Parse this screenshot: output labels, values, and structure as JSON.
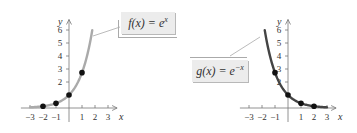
{
  "chart_data": [
    {
      "type": "line",
      "title": "",
      "function_label": "f(x) = e^x",
      "xlabel": "x",
      "ylabel": "y",
      "x_ticks": [
        -3,
        -2,
        -1,
        1,
        2,
        3
      ],
      "y_ticks": [
        2,
        3,
        4,
        5,
        6
      ],
      "xlim": [
        -3.5,
        3.5
      ],
      "ylim": [
        0,
        6.5
      ],
      "grid": false,
      "curve_color": "#aaaaaa",
      "series": [
        {
          "name": "f(x) = e^x",
          "x": [
            -3,
            -2.5,
            -2,
            -1.5,
            -1,
            -0.5,
            0,
            0.5,
            1,
            1.5,
            1.79
          ],
          "values": [
            0.05,
            0.08,
            0.14,
            0.22,
            0.37,
            0.61,
            1,
            1.65,
            2.72,
            4.48,
            6
          ]
        }
      ],
      "points": [
        {
          "x": -2,
          "y": 0.135
        },
        {
          "x": -1,
          "y": 0.368
        },
        {
          "x": 0,
          "y": 1
        },
        {
          "x": 1,
          "y": 2.718
        }
      ]
    },
    {
      "type": "line",
      "title": "",
      "function_label": "g(x) = e^-x",
      "xlabel": "x",
      "ylabel": "y",
      "x_ticks": [
        -3,
        -2,
        -1,
        1,
        2,
        3
      ],
      "y_ticks": [
        2,
        3,
        4,
        5,
        6
      ],
      "xlim": [
        -3.5,
        3.5
      ],
      "ylim": [
        0,
        6.5
      ],
      "grid": false,
      "curve_color": "#444444",
      "series": [
        {
          "name": "g(x) = e^-x",
          "x": [
            -1.79,
            -1.5,
            -1,
            -0.5,
            0,
            0.5,
            1,
            1.5,
            2,
            2.5,
            3
          ],
          "values": [
            6,
            4.48,
            2.72,
            1.65,
            1,
            0.61,
            0.37,
            0.22,
            0.14,
            0.08,
            0.05
          ]
        }
      ],
      "points": [
        {
          "x": -1,
          "y": 2.718
        },
        {
          "x": 0,
          "y": 1
        },
        {
          "x": 1,
          "y": 0.368
        },
        {
          "x": 2,
          "y": 0.135
        }
      ]
    }
  ],
  "labels": {
    "left": {
      "f": "f",
      "open": "(",
      "var": "x",
      "close": ")",
      "eq": " = ",
      "base": "e",
      "exp": "x"
    },
    "right": {
      "f": "g",
      "open": "(",
      "var": "x",
      "close": ")",
      "eq": " = ",
      "base": "e",
      "exp": "−x"
    }
  },
  "axes": {
    "x_name": "x",
    "y_name": "y",
    "x_tick_labels": [
      "−3",
      "−2",
      "−1",
      "1",
      "2",
      "3"
    ],
    "y_tick_labels": [
      "2",
      "3",
      "4",
      "5",
      "6"
    ]
  }
}
